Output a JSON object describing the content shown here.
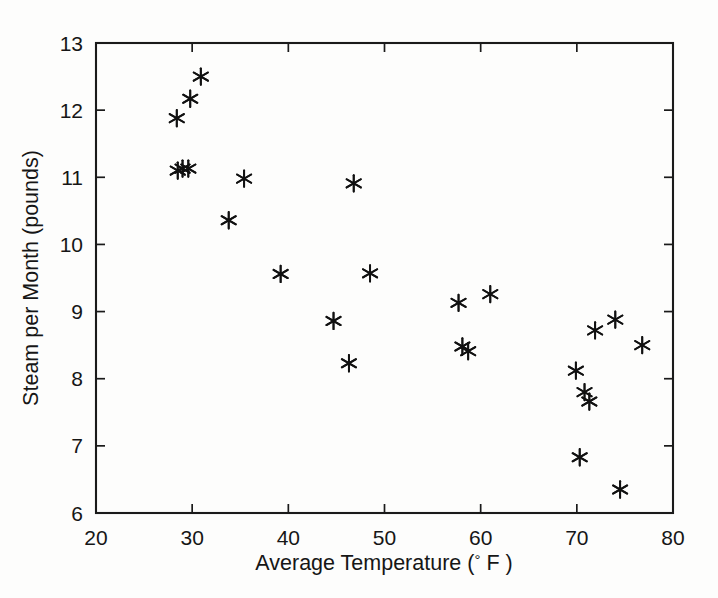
{
  "chart_data": {
    "type": "scatter",
    "title": "",
    "xlabel": "Average Temperature (° F )",
    "xlabel_parts": {
      "text_before": "Average Temperature",
      "paren_open": "(",
      "degree": "°",
      "unit": "F",
      "paren_close": ")"
    },
    "ylabel": "Steam per Month (pounds)",
    "xlim": [
      20,
      80
    ],
    "ylim": [
      6,
      13
    ],
    "xticks": [
      20,
      30,
      40,
      50,
      60,
      70,
      80
    ],
    "yticks": [
      6,
      7,
      8,
      9,
      10,
      11,
      12,
      13
    ],
    "xtick_labels": [
      "20",
      "30",
      "40",
      "50",
      "60",
      "70",
      "80"
    ],
    "ytick_labels": [
      "6",
      "7",
      "8",
      "9",
      "10",
      "11",
      "12",
      "13"
    ],
    "grid": false,
    "legend": null,
    "marker": "asterisk",
    "marker_color": "#111111",
    "background_color": "#fdfdfc",
    "axis_color": "#1a1a1a",
    "n_points": 25,
    "x": [
      28.5,
      29.0,
      29.8,
      30.9,
      28.4,
      29.6,
      33.8,
      35.4,
      39.2,
      44.7,
      46.3,
      46.8,
      48.5,
      57.7,
      58.1,
      58.7,
      61.0,
      69.9,
      70.3,
      70.8,
      71.3,
      71.9,
      74.0,
      74.5,
      76.8
    ],
    "y": [
      11.1,
      11.13,
      12.17,
      12.5,
      11.88,
      11.13,
      10.36,
      10.98,
      9.56,
      8.86,
      8.23,
      10.91,
      9.57,
      9.13,
      8.48,
      8.41,
      9.26,
      8.12,
      6.83,
      7.8,
      7.66,
      8.72,
      8.88,
      6.35,
      8.5
    ],
    "points": [
      {
        "x": 28.5,
        "y": 11.1
      },
      {
        "x": 29.0,
        "y": 11.13
      },
      {
        "x": 29.8,
        "y": 12.17
      },
      {
        "x": 30.9,
        "y": 12.5
      },
      {
        "x": 28.4,
        "y": 11.88
      },
      {
        "x": 29.6,
        "y": 11.13
      },
      {
        "x": 33.8,
        "y": 10.36
      },
      {
        "x": 35.4,
        "y": 10.98
      },
      {
        "x": 39.2,
        "y": 9.56
      },
      {
        "x": 44.7,
        "y": 8.86
      },
      {
        "x": 46.3,
        "y": 8.23
      },
      {
        "x": 46.8,
        "y": 10.91
      },
      {
        "x": 48.5,
        "y": 9.57
      },
      {
        "x": 57.7,
        "y": 9.13
      },
      {
        "x": 58.1,
        "y": 8.48
      },
      {
        "x": 58.7,
        "y": 8.41
      },
      {
        "x": 61.0,
        "y": 9.26
      },
      {
        "x": 69.9,
        "y": 8.12
      },
      {
        "x": 70.3,
        "y": 6.83
      },
      {
        "x": 70.8,
        "y": 7.8
      },
      {
        "x": 71.3,
        "y": 7.66
      },
      {
        "x": 71.9,
        "y": 8.72
      },
      {
        "x": 74.0,
        "y": 8.88
      },
      {
        "x": 74.5,
        "y": 6.35
      },
      {
        "x": 76.8,
        "y": 8.5
      }
    ]
  }
}
